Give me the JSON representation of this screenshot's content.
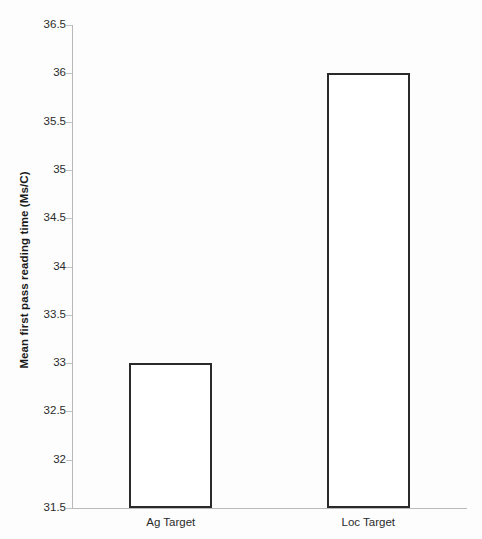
{
  "chart_data": {
    "type": "bar",
    "title": "",
    "subtitle": "",
    "xlabel": "",
    "ylabel": "Mean first pass reading time (Ms/C)",
    "categories": [
      "Ag Target",
      "Loc Target"
    ],
    "values": [
      33.0,
      36.0
    ],
    "series": [
      {
        "name": "Mean first pass reading time",
        "values": [
          33.0,
          36.0
        ]
      }
    ],
    "ylim": [
      31.5,
      36.5
    ],
    "ytick_step": 0.5,
    "ytick_labels": [
      "36.5",
      "36",
      "35.5",
      "35",
      "34.5",
      "34",
      "33.5",
      "33",
      "32.5",
      "32",
      "31.5"
    ],
    "ytick_values": [
      36.5,
      36,
      35.5,
      35,
      34.5,
      34,
      33.5,
      33,
      32.5,
      32,
      31.5
    ],
    "grid": false,
    "legend": false,
    "legend_position": "none",
    "bar_fill_color": "#ffffff",
    "bar_border_color": "#2a2a2a",
    "axis_color": "#b9b9b9",
    "text_color": "#2b2b2b",
    "background_color": "#fdfdfd"
  }
}
